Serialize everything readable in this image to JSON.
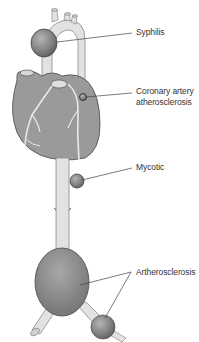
{
  "diagram": {
    "labels": {
      "syphilis": "Syphilis",
      "coronary_line1": "Coronary artery",
      "coronary_line2": "atherosclerosis",
      "mycotic": "Mycotic",
      "artherosclerosis": "Artherosclerosis"
    },
    "colors": {
      "vessel": "#e2e2e2",
      "vessel_outline": "#8a8a8a",
      "heart": "#9a9a9a",
      "aneurysm": "#7f7f7f",
      "leader_line": "#444444",
      "text": "#333333"
    }
  }
}
